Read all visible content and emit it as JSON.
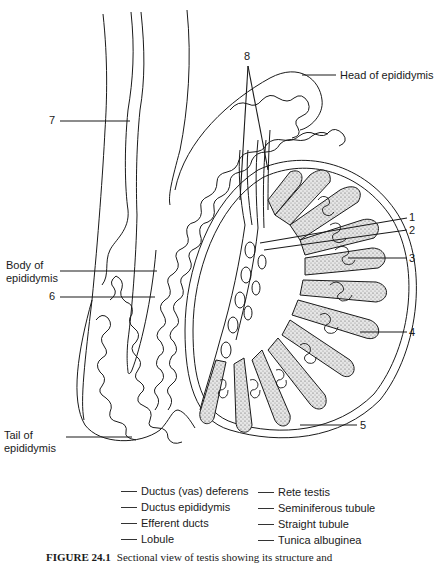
{
  "figure": {
    "type": "anatomical-diagram",
    "caption_number": "FIGURE 24.1",
    "caption_text": "Sectional view of testis showing its structure and"
  },
  "labels": {
    "n1": "1",
    "n2": "2",
    "n3": "3",
    "n4": "4",
    "n5": "5",
    "n6": "6",
    "n7": "7",
    "n8": "8",
    "head": "Head of epididymis",
    "body_line1": "Body of",
    "body_line2": "epididymis",
    "tail_line1": "Tail of",
    "tail_line2": "epididymis"
  },
  "legend": {
    "left": [
      "Ductus (vas) deferens",
      "Ductus epididymis",
      "Efferent ducts",
      "Lobule"
    ],
    "right": [
      "Rete testis",
      "Seminiferous tubule",
      "Straight tubule",
      "Tunica albuginea"
    ]
  },
  "colors": {
    "line": "#1a1a1a",
    "stipple": "#7a7a7a",
    "background": "#ffffff"
  }
}
